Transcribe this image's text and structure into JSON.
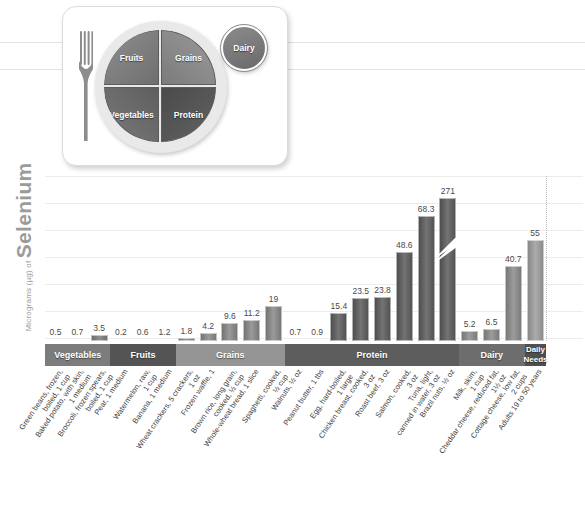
{
  "y_axis": {
    "prefix": "Micrograms (µg) of ",
    "nutrient": "Selenium"
  },
  "plate": {
    "quadrants": [
      {
        "name": "Fruits",
        "label": "Fruits"
      },
      {
        "name": "Grains",
        "label": "Grains"
      },
      {
        "name": "Vegetables",
        "label": "Vegetables"
      },
      {
        "name": "Protein",
        "label": "Protein"
      }
    ],
    "dairy_label": "Dairy"
  },
  "chart_data": {
    "type": "bar",
    "title": "",
    "xlabel": "",
    "ylabel": "Micrograms (µg) of Selenium",
    "ylim": [
      0,
      80
    ],
    "grid": true,
    "legend": "none",
    "note": "Tallest bar (Brazil nuts, 271 µg) is drawn with a broken-axis slash mark.",
    "groups": [
      {
        "name": "Vegetables",
        "label": "Vegetables",
        "count": 3
      },
      {
        "name": "Fruits",
        "label": "Fruits",
        "count": 3
      },
      {
        "name": "Grains",
        "label": "Grains",
        "count": 5
      },
      {
        "name": "Protein",
        "label": "Protein",
        "count": 8
      },
      {
        "name": "Dairy",
        "label": "Dairy",
        "count": 3
      },
      {
        "name": "Daily Needs",
        "label": "Daily\nNeeds",
        "count": 1
      }
    ],
    "categories": [
      "Green beans, frozen, boiled, 1 cup",
      "Baked potato, with skin, 1 medium",
      "Broccoli, frozen spears, boiled, 1 cup",
      "Pear, 1 medium",
      "Watermelon, raw, 1 cup",
      "Banana, 1 medium",
      "Wheat crackers, 5 crackers, 1 oz",
      "Frozen waffle, 1",
      "Brown rice, long grain, cooked, ½ cup",
      "Whole-wheat bread, 1 slice",
      "Spaghetti, cooked, ½ cup",
      "Walnuts, ½ oz",
      "Peanut butter, 1 tbs",
      "Egg, hard-boiled, 1 large",
      "Chicken breast, cooked, 3 oz",
      "Roast beef, 3 oz",
      "Salmon, cooked, 3 oz",
      "Tuna, light, canned in water, 3 oz",
      "Brazil nuts, ½ oz",
      "Milk, skim, 1 cup",
      "Cheddar cheese, reduced fat, 1½ oz",
      "Cottage cheese, low fat, 2 cups",
      "Adults 19 to 50 years"
    ],
    "values": [
      0.5,
      0.7,
      3.5,
      0.2,
      0.6,
      1.2,
      1.8,
      4.2,
      9.6,
      11.2,
      19,
      0.7,
      0.9,
      15.4,
      23.5,
      23.8,
      48.6,
      68.3,
      271,
      5.2,
      6.5,
      40.7,
      55
    ],
    "value_labels": [
      "0.5",
      "0.7",
      "3.5",
      "0.2",
      "0.6",
      "1.2",
      "1.8",
      "4.2",
      "9.6",
      "11.2",
      "19",
      "0.7",
      "0.9",
      "15.4",
      "23.5",
      "23.8",
      "48.6",
      "68.3",
      "271",
      "5.2",
      "6.5",
      "40.7",
      "55"
    ],
    "group_of": [
      "Vegetables",
      "Vegetables",
      "Vegetables",
      "Fruits",
      "Fruits",
      "Fruits",
      "Grains",
      "Grains",
      "Grains",
      "Grains",
      "Grains",
      "Protein",
      "Protein",
      "Protein",
      "Protein",
      "Protein",
      "Protein",
      "Protein",
      "Protein",
      "Dairy",
      "Dairy",
      "Dairy",
      "Daily Needs"
    ]
  },
  "colors": {
    "vegetables": "#7c7c7c",
    "fruits": "#545454",
    "grains": "#959595",
    "protein": "#5d5d5d",
    "dairy": "#6d6d6d",
    "daily_needs": "#4f4f4f",
    "gridline": "#ececec",
    "axis_text": "#9b9b9b"
  }
}
